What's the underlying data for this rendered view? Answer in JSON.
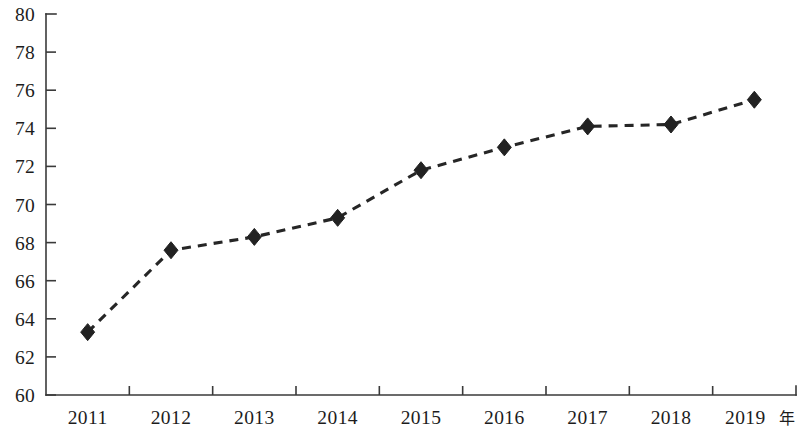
{
  "chart_data": {
    "type": "line",
    "title": "",
    "subtitle": "",
    "xlabel": "年",
    "ylabel": "",
    "categories": [
      "2011",
      "2012",
      "2013",
      "2014",
      "2015",
      "2016",
      "2017",
      "2018",
      "2019"
    ],
    "values": [
      63.3,
      67.6,
      68.3,
      69.3,
      71.8,
      73.0,
      74.1,
      74.2,
      75.5
    ],
    "series": [
      {
        "name": "",
        "values": [
          63.3,
          67.6,
          68.3,
          69.3,
          71.8,
          73.0,
          74.1,
          74.2,
          75.5
        ]
      }
    ],
    "ylim": [
      60,
      80
    ],
    "ytick_labels": [
      "80",
      "78",
      "76",
      "74",
      "72",
      "70",
      "68",
      "66",
      "64",
      "62",
      "60"
    ],
    "ytick_values": [
      80,
      78,
      76,
      74,
      72,
      70,
      68,
      66,
      64,
      62,
      60
    ],
    "xtick_labels": [
      "2011",
      "2012",
      "2013",
      "2014",
      "2015",
      "2016",
      "2017",
      "2018",
      "2019"
    ],
    "grid": false,
    "legend": false,
    "legend_position": "none",
    "line_style": "dashed",
    "marker_style": "diamond",
    "line_color": "#262626",
    "marker_color": "#222222",
    "axis_color": "#3a3a3a",
    "background_color": "#ffffff",
    "annotations": []
  },
  "axis": {
    "x_unit_suffix": "年"
  }
}
